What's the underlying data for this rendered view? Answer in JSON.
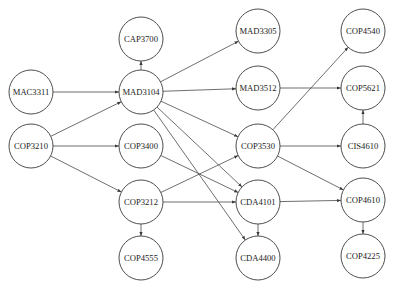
{
  "diagram": {
    "type": "directed-graph",
    "title": "",
    "node_radius": 22,
    "colors": {
      "stroke": "#3a3a3a",
      "edge": "#4a4a4a",
      "fill": "#ffffff",
      "text": "#1a1a1a",
      "background": "#ffffff"
    },
    "nodes": [
      {
        "id": "CAP3700",
        "label": "CAP3700",
        "x": 141,
        "y": 39
      },
      {
        "id": "MAD3104",
        "label": "MAD3104",
        "x": 141,
        "y": 92
      },
      {
        "id": "MAC3311",
        "label": "MAC3311",
        "x": 31,
        "y": 92
      },
      {
        "id": "COP3210",
        "label": "COP3210",
        "x": 31,
        "y": 146
      },
      {
        "id": "COP3400",
        "label": "COP3400",
        "x": 141,
        "y": 146
      },
      {
        "id": "COP3212",
        "label": "COP3212",
        "x": 141,
        "y": 202
      },
      {
        "id": "COP4555",
        "label": "COP4555",
        "x": 141,
        "y": 258
      },
      {
        "id": "MAD3305",
        "label": "MAD3305",
        "x": 258,
        "y": 31
      },
      {
        "id": "MAD3512",
        "label": "MAD3512",
        "x": 258,
        "y": 88
      },
      {
        "id": "COP3530",
        "label": "COP3530",
        "x": 258,
        "y": 146
      },
      {
        "id": "CDA4101",
        "label": "CDA4101",
        "x": 258,
        "y": 202
      },
      {
        "id": "CDA4400",
        "label": "CDA4400",
        "x": 258,
        "y": 258
      },
      {
        "id": "COP4540",
        "label": "COP4540",
        "x": 363,
        "y": 31
      },
      {
        "id": "COP5621",
        "label": "COP5621",
        "x": 363,
        "y": 88
      },
      {
        "id": "CIS4610",
        "label": "CIS4610",
        "x": 363,
        "y": 146
      },
      {
        "id": "COP4610",
        "label": "COP4610",
        "x": 363,
        "y": 200
      },
      {
        "id": "COP4225",
        "label": "COP4225",
        "x": 363,
        "y": 256
      }
    ],
    "edges": [
      {
        "from": "MAD3104",
        "to": "CAP3700"
      },
      {
        "from": "MAC3311",
        "to": "MAD3104"
      },
      {
        "from": "COP3210",
        "to": "MAD3104"
      },
      {
        "from": "COP3210",
        "to": "COP3400"
      },
      {
        "from": "COP3210",
        "to": "COP3212"
      },
      {
        "from": "MAD3104",
        "to": "MAD3305"
      },
      {
        "from": "MAD3104",
        "to": "MAD3512"
      },
      {
        "from": "MAD3104",
        "to": "COP3530"
      },
      {
        "from": "MAD3104",
        "to": "CDA4101"
      },
      {
        "from": "MAD3104",
        "to": "CDA4400"
      },
      {
        "from": "COP3400",
        "to": "CDA4101"
      },
      {
        "from": "COP3212",
        "to": "COP3530"
      },
      {
        "from": "COP3212",
        "to": "CDA4101"
      },
      {
        "from": "COP3212",
        "to": "COP4555"
      },
      {
        "from": "CDA4101",
        "to": "CDA4400"
      },
      {
        "from": "MAD3512",
        "to": "COP5621"
      },
      {
        "from": "COP3530",
        "to": "COP4540"
      },
      {
        "from": "COP3530",
        "to": "CIS4610"
      },
      {
        "from": "COP3530",
        "to": "COP4610"
      },
      {
        "from": "CIS4610",
        "to": "COP5621"
      },
      {
        "from": "CDA4101",
        "to": "COP4610"
      },
      {
        "from": "COP4610",
        "to": "COP4225"
      }
    ]
  }
}
